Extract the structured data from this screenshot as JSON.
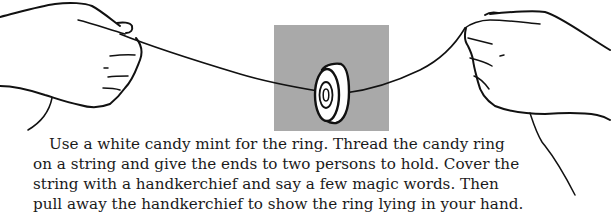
{
  "illustration": {
    "description": "Two hands holding a string with a white candy mint ring threaded on it",
    "panel_color": "#a9a9a9",
    "ink_color": "#111111"
  },
  "caption": {
    "lines": [
      "Use a white candy mint for the ring. Thread the candy ring",
      "on a string and give the ends to two persons to hold. Cover the",
      "string with a handkerchief and say a few magic words. Then",
      "pull away the handkerchief to show the ring lying in your hand."
    ]
  }
}
